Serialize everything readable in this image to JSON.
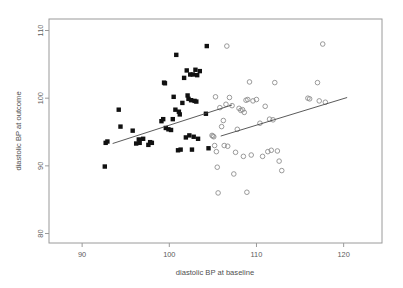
{
  "chart_data": {
    "type": "scatter",
    "title": "",
    "xlabel": "diastolic BP at baseline",
    "ylabel": "diastolic BP at outcome",
    "xlim": [
      86.2,
      124.4
    ],
    "ylim": [
      78.6,
      111.7
    ],
    "xticks": [
      90,
      100,
      110,
      120
    ],
    "yticks": [
      80,
      90,
      100,
      110
    ],
    "xtick_labels": [
      "90",
      "100",
      "110",
      "120"
    ],
    "ytick_labels": [
      "80",
      "90",
      "100",
      "110"
    ],
    "grid": false,
    "legend": "none",
    "series": [
      {
        "name": "group-filled-squares",
        "marker": "filled-square",
        "color": "#111111",
        "points": [
          [
            92.6,
            89.9
          ],
          [
            92.7,
            93.4
          ],
          [
            92.9,
            93.6
          ],
          [
            94.2,
            98.3
          ],
          [
            94.4,
            95.8
          ],
          [
            95.8,
            95.2
          ],
          [
            96.2,
            93.3
          ],
          [
            96.5,
            93.9
          ],
          [
            96.6,
            93.4
          ],
          [
            97.0,
            94.0
          ],
          [
            97.6,
            93.1
          ],
          [
            97.8,
            93.5
          ],
          [
            98.0,
            93.4
          ],
          [
            99.1,
            96.6
          ],
          [
            99.3,
            96.9
          ],
          [
            99.4,
            102.3
          ],
          [
            99.5,
            102.2
          ],
          [
            99.6,
            95.6
          ],
          [
            99.9,
            95.4
          ],
          [
            100.2,
            95.3
          ],
          [
            100.4,
            96.9
          ],
          [
            100.5,
            100.2
          ],
          [
            100.7,
            98.3
          ],
          [
            100.8,
            106.4
          ],
          [
            101.0,
            92.3
          ],
          [
            101.1,
            98.0
          ],
          [
            101.2,
            97.6
          ],
          [
            101.3,
            92.4
          ],
          [
            101.5,
            99.3
          ],
          [
            101.7,
            103.0
          ],
          [
            101.9,
            94.2
          ],
          [
            102.0,
            104.1
          ],
          [
            102.1,
            100.4
          ],
          [
            102.2,
            99.9
          ],
          [
            102.3,
            94.5
          ],
          [
            102.4,
            103.5
          ],
          [
            102.5,
            99.7
          ],
          [
            102.6,
            92.4
          ],
          [
            102.7,
            103.5
          ],
          [
            102.8,
            94.3
          ],
          [
            102.9,
            99.6
          ],
          [
            103.0,
            104.2
          ],
          [
            103.1,
            99.5
          ],
          [
            103.2,
            103.4
          ],
          [
            103.3,
            94.0
          ],
          [
            103.5,
            104.0
          ],
          [
            104.2,
            97.7
          ],
          [
            104.3,
            107.7
          ],
          [
            104.5,
            92.6
          ]
        ]
      },
      {
        "name": "group-open-circles",
        "marker": "open-circle",
        "color": "#8e8e8e",
        "points": [
          [
            104.9,
            94.5
          ],
          [
            105.0,
            94.4
          ],
          [
            105.1,
            94.3
          ],
          [
            105.2,
            93.0
          ],
          [
            105.3,
            100.2
          ],
          [
            105.4,
            92.1
          ],
          [
            105.5,
            89.8
          ],
          [
            105.6,
            86.0
          ],
          [
            105.8,
            98.6
          ],
          [
            106.0,
            95.8
          ],
          [
            106.2,
            96.7
          ],
          [
            106.3,
            93.0
          ],
          [
            106.5,
            99.1
          ],
          [
            106.6,
            107.7
          ],
          [
            106.7,
            92.9
          ],
          [
            106.9,
            100.1
          ],
          [
            107.2,
            98.9
          ],
          [
            107.4,
            88.8
          ],
          [
            107.6,
            92.0
          ],
          [
            107.8,
            95.4
          ],
          [
            108.0,
            98.5
          ],
          [
            108.2,
            98.2
          ],
          [
            108.4,
            98.3
          ],
          [
            108.5,
            91.4
          ],
          [
            108.6,
            97.9
          ],
          [
            108.8,
            99.7
          ],
          [
            108.9,
            86.1
          ],
          [
            109.0,
            99.8
          ],
          [
            109.2,
            102.4
          ],
          [
            109.4,
            91.6
          ],
          [
            109.6,
            99.6
          ],
          [
            110.0,
            99.8
          ],
          [
            110.4,
            96.3
          ],
          [
            110.7,
            91.4
          ],
          [
            111.0,
            98.8
          ],
          [
            111.3,
            92.1
          ],
          [
            111.5,
            96.9
          ],
          [
            111.7,
            92.3
          ],
          [
            111.9,
            96.8
          ],
          [
            112.1,
            102.3
          ],
          [
            112.4,
            92.2
          ],
          [
            112.6,
            90.7
          ],
          [
            112.9,
            89.3
          ],
          [
            115.9,
            100.0
          ],
          [
            116.1,
            99.9
          ],
          [
            117.0,
            102.3
          ],
          [
            117.2,
            99.6
          ],
          [
            117.6,
            108.0
          ],
          [
            117.9,
            99.4
          ]
        ]
      }
    ],
    "fit_lines": [
      {
        "name": "fit-line-squares",
        "x_start": 93.5,
        "y_start": 93.3,
        "x_end": 107.2,
        "y_end": 99.0
      },
      {
        "name": "fit-line-circles",
        "x_start": 105.9,
        "y_start": 94.4,
        "x_end": 120.4,
        "y_end": 100.1
      }
    ]
  }
}
